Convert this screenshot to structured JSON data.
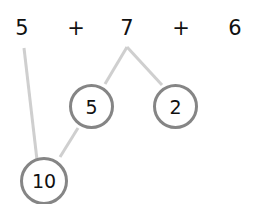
{
  "expression": {
    "tokens": [
      "5",
      "+",
      "7",
      "+",
      "6"
    ]
  },
  "split_nodes": [
    {
      "label": "5"
    },
    {
      "label": "2"
    }
  ],
  "sum_node": {
    "label": "10"
  },
  "colors": {
    "line": "#cfcfcf",
    "circle_border": "#858585",
    "text": "#111111"
  }
}
